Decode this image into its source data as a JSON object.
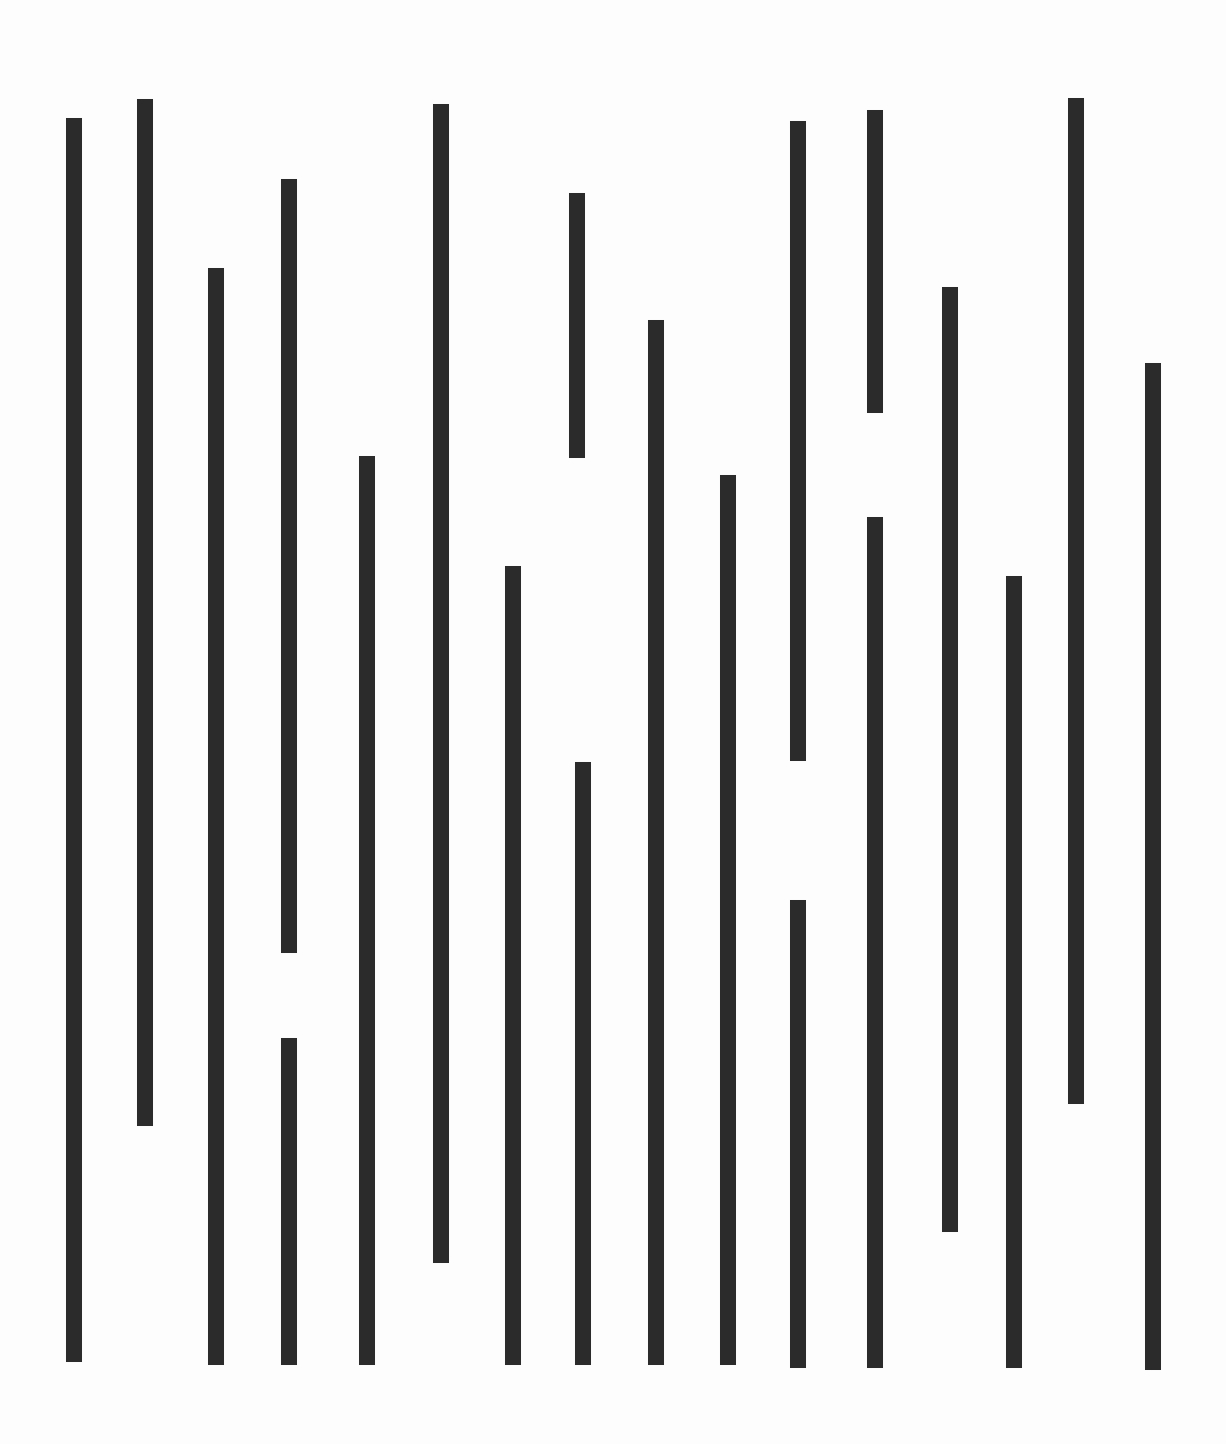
{
  "figure": {
    "type": "abstract-vertical-bar-pattern",
    "canvas_width": 1226,
    "canvas_height": 1444,
    "background_color": "#fdfdfd",
    "bar_color": "#2b2b2b",
    "bar_width": 16,
    "segment_count": 20,
    "column_count": 16
  },
  "chart_data": {
    "type": "bar",
    "title": "",
    "xlabel": "",
    "ylabel": "",
    "grid": false,
    "legend": null,
    "orientation": "vertical",
    "bar_color": "#2b2b2b",
    "bar_width": 16,
    "xlim": [
      0,
      1226
    ],
    "ylim": [
      0,
      1444
    ],
    "categories": [
      "c1",
      "c2",
      "c3",
      "c4",
      "c5",
      "c6",
      "c7",
      "c8",
      "c9",
      "c10",
      "c11",
      "c12",
      "c13",
      "c14",
      "c15",
      "c16"
    ],
    "segments": [
      {
        "id": "seg-1",
        "column": "c1",
        "x": 66,
        "y_top": 118,
        "y_bottom": 1362,
        "length": 1244
      },
      {
        "id": "seg-2",
        "column": "c2",
        "x": 137,
        "y_top": 99,
        "y_bottom": 1126,
        "length": 1027
      },
      {
        "id": "seg-3",
        "column": "c3",
        "x": 208,
        "y_top": 268,
        "y_bottom": 1365,
        "length": 1097
      },
      {
        "id": "seg-4",
        "column": "c4",
        "x": 281,
        "y_top": 179,
        "y_bottom": 953,
        "length": 774
      },
      {
        "id": "seg-5",
        "column": "c4",
        "x": 281,
        "y_top": 1038,
        "y_bottom": 1365,
        "length": 327
      },
      {
        "id": "seg-6",
        "column": "c5",
        "x": 359,
        "y_top": 456,
        "y_bottom": 1365,
        "length": 909
      },
      {
        "id": "seg-7",
        "column": "c6",
        "x": 433,
        "y_top": 104,
        "y_bottom": 1263,
        "length": 1159
      },
      {
        "id": "seg-8",
        "column": "c7",
        "x": 505,
        "y_top": 566,
        "y_bottom": 1365,
        "length": 799
      },
      {
        "id": "seg-9",
        "column": "c8",
        "x": 569,
        "y_top": 193,
        "y_bottom": 458,
        "length": 265
      },
      {
        "id": "seg-10",
        "column": "c8",
        "x": 575,
        "y_top": 762,
        "y_bottom": 1365,
        "length": 603
      },
      {
        "id": "seg-11",
        "column": "c9",
        "x": 648,
        "y_top": 320,
        "y_bottom": 1365,
        "length": 1045
      },
      {
        "id": "seg-12",
        "column": "c10",
        "x": 720,
        "y_top": 475,
        "y_bottom": 1365,
        "length": 890
      },
      {
        "id": "seg-13",
        "column": "c11",
        "x": 790,
        "y_top": 121,
        "y_bottom": 761,
        "length": 640
      },
      {
        "id": "seg-14",
        "column": "c11",
        "x": 790,
        "y_top": 900,
        "y_bottom": 1368,
        "length": 468
      },
      {
        "id": "seg-15",
        "column": "c12",
        "x": 867,
        "y_top": 110,
        "y_bottom": 413,
        "length": 303
      },
      {
        "id": "seg-16",
        "column": "c12",
        "x": 867,
        "y_top": 517,
        "y_bottom": 1368,
        "length": 851
      },
      {
        "id": "seg-17",
        "column": "c13",
        "x": 942,
        "y_top": 287,
        "y_bottom": 1232,
        "length": 945
      },
      {
        "id": "seg-18",
        "column": "c14",
        "x": 1006,
        "y_top": 576,
        "y_bottom": 1368,
        "length": 792
      },
      {
        "id": "seg-19",
        "column": "c15",
        "x": 1068,
        "y_top": 98,
        "y_bottom": 1104,
        "length": 1006
      },
      {
        "id": "seg-20",
        "column": "c16",
        "x": 1145,
        "y_top": 363,
        "y_bottom": 1370,
        "length": 1007
      }
    ]
  }
}
